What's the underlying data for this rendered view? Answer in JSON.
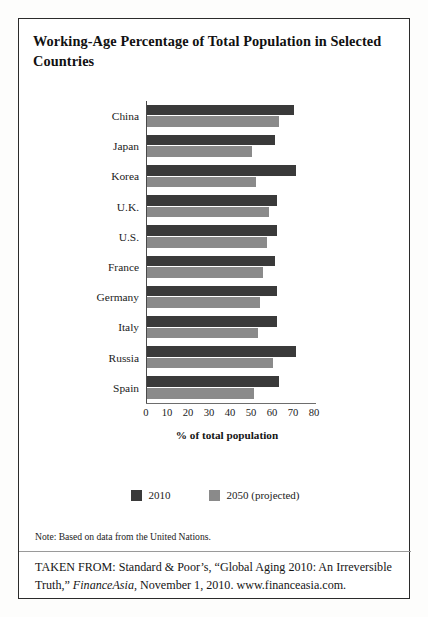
{
  "title": "Working-Age Percentage of Total Population in Selected Countries",
  "chart_data": {
    "type": "bar",
    "orientation": "horizontal",
    "title": "Working-Age Percentage of Total Population in Selected Countries",
    "xlabel": "% of total population",
    "ylabel": "",
    "xlim": [
      0,
      80
    ],
    "xticks": [
      0,
      10,
      20,
      30,
      40,
      50,
      60,
      70,
      80
    ],
    "grid": false,
    "legend_position": "bottom",
    "categories": [
      "China",
      "Japan",
      "Korea",
      "U.K.",
      "U.S.",
      "France",
      "Germany",
      "Italy",
      "Russia",
      "Spain"
    ],
    "series": [
      {
        "name": "2010",
        "color": "#3a3a3a",
        "values": [
          70,
          61,
          71,
          62,
          62,
          61,
          62,
          62,
          71,
          63
        ]
      },
      {
        "name": "2050 (projected)",
        "color": "#8a8a8a",
        "values": [
          63,
          50,
          52,
          58,
          57,
          55,
          54,
          53,
          60,
          51
        ]
      }
    ]
  },
  "legend": {
    "items": [
      {
        "label": "2010",
        "color": "#3a3a3a"
      },
      {
        "label": "2050 (projected)",
        "color": "#8a8a8a"
      }
    ]
  },
  "note": "Note: Based on data from the United Nations.",
  "source": {
    "lead": "TAKEN FROM: Standard & Poor’s, “Global Aging 2010: An Irreversible Truth,” ",
    "publication": "FinanceAsia",
    "tail": ", November 1, 2010. www.financeasia.com."
  }
}
